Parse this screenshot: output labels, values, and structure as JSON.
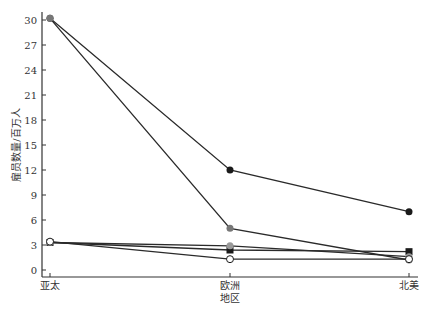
{
  "chart_data": {
    "type": "line",
    "title": "",
    "xlabel": "地区",
    "ylabel": "雇员数量/百万人",
    "categories": [
      "亚太",
      "欧洲",
      "北美"
    ],
    "ylim": [
      0,
      30
    ],
    "yticks": [
      0,
      3,
      6,
      9,
      12,
      15,
      18,
      21,
      24,
      27,
      30
    ],
    "grid": false,
    "legend": null,
    "series": [
      {
        "name": "series-1",
        "marker": "filled-circle",
        "color": "#1a1a1a",
        "values": [
          30.2,
          12.0,
          7.0
        ]
      },
      {
        "name": "series-2",
        "marker": "filled-circle",
        "color": "#777777",
        "values": [
          30.2,
          5.0,
          1.2
        ]
      },
      {
        "name": "series-3",
        "marker": "filled-square",
        "color": "#1a1a1a",
        "values": [
          3.3,
          2.4,
          2.2
        ]
      },
      {
        "name": "series-4",
        "marker": "filled-circle",
        "color": "#999999",
        "values": [
          3.3,
          2.9,
          1.6
        ]
      },
      {
        "name": "series-5",
        "marker": "open-circle",
        "color": "#1a1a1a",
        "values": [
          3.4,
          1.3,
          1.3
        ]
      }
    ]
  }
}
